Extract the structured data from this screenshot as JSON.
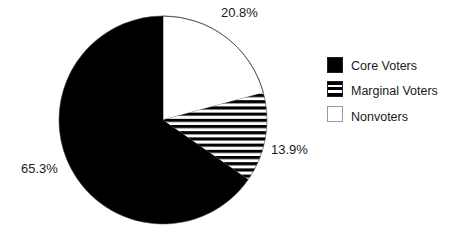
{
  "chart_data": {
    "type": "pie",
    "title": "",
    "categories": [
      "Core Voters",
      "Marginal Voters",
      "Nonvoters"
    ],
    "values": [
      65.3,
      13.9,
      20.8
    ],
    "labels": [
      "65.3%",
      "13.9%",
      "20.8%"
    ],
    "units": "%",
    "start_angle": "12 o'clock",
    "direction": "clockwise, beginning with Nonvoters",
    "legend_position": "right",
    "fills": {
      "Core Voters": "solid black",
      "Marginal Voters": "horizontal black/white stripes",
      "Nonvoters": "white"
    }
  },
  "colors": {
    "core": "#000000",
    "marginal_stripe": "#000000",
    "nonvoters": "#ffffff",
    "outline": "#333333"
  },
  "legend": {
    "items": [
      {
        "label": "Core Voters",
        "fill": "solid"
      },
      {
        "label": "Marginal Voters",
        "fill": "striped"
      },
      {
        "label": "Nonvoters",
        "fill": "white"
      }
    ]
  },
  "slice_labels": {
    "core": "65.3%",
    "marginal": "13.9%",
    "nonvoters": "20.8%"
  }
}
